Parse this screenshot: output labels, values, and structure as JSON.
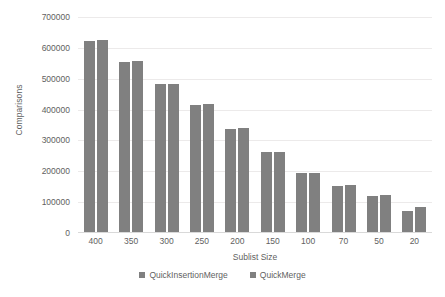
{
  "chart_data": {
    "type": "bar",
    "title": "",
    "xlabel": "Sublist Size",
    "ylabel": "Comparisons",
    "categories": [
      "400",
      "350",
      "300",
      "250",
      "200",
      "150",
      "100",
      "70",
      "50",
      "20"
    ],
    "series": [
      {
        "name": "QuickInsertionMerge",
        "color": "#808080",
        "values": [
          622000,
          555000,
          483000,
          415000,
          337000,
          262000,
          194000,
          152000,
          120000,
          70000
        ]
      },
      {
        "name": "QuickMerge",
        "color": "#808080",
        "values": [
          625000,
          557000,
          484000,
          418000,
          339000,
          264000,
          196000,
          155000,
          123000,
          85000
        ]
      }
    ],
    "ylim": [
      0,
      700000
    ],
    "ytick_step": 100000,
    "yticks": [
      "700000",
      "600000",
      "500000",
      "400000",
      "300000",
      "200000",
      "100000",
      "0"
    ],
    "grid": true,
    "legend_position": "bottom"
  },
  "legend": {
    "items": [
      {
        "label": "QuickInsertionMerge"
      },
      {
        "label": "QuickMerge"
      }
    ]
  },
  "colors": {
    "bar": "#808080",
    "gridline": "#eceaea",
    "axis": "#d9d9d9",
    "text": "#5f5f5f",
    "background": "#ffffff"
  }
}
